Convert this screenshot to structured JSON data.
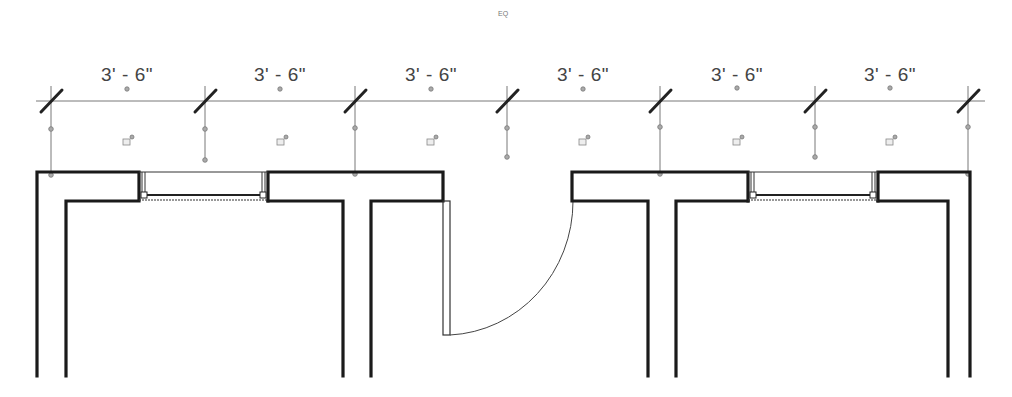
{
  "drawing": {
    "type": "floor-plan-dimension-view",
    "eq_label": "EQ",
    "dimension_line": {
      "y": 101,
      "x_start": 36,
      "x_end": 985,
      "ticks_x": [
        51,
        205,
        355,
        507,
        660,
        815,
        968
      ],
      "segments": [
        {
          "label": "3' - 6\"",
          "center_x": 127
        },
        {
          "label": "3' - 6\"",
          "center_x": 280
        },
        {
          "label": "3' - 6\"",
          "center_x": 431
        },
        {
          "label": "3' - 6\"",
          "center_x": 583
        },
        {
          "label": "3' - 6\"",
          "center_x": 737
        },
        {
          "label": "3' - 6\"",
          "center_x": 890
        }
      ]
    },
    "elements": {
      "windows": 2,
      "doors": 1,
      "wall_color": "#1a1a1a"
    }
  }
}
